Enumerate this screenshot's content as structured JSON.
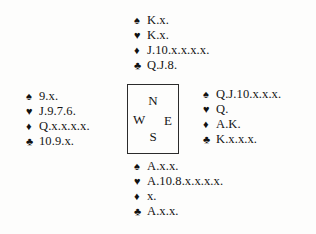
{
  "diagram": {
    "type": "bridge-deal",
    "suit_symbols": {
      "spades": "♠",
      "hearts": "♥",
      "diamonds": "♦",
      "clubs": "♣"
    },
    "compass": {
      "north": "N",
      "west": "W",
      "east": "E",
      "south": "S"
    },
    "hands": {
      "north": {
        "label": "North",
        "spades": "K.x.",
        "hearts": "K.x.",
        "diamonds": "J.10.x.x.x.x.",
        "clubs": "Q.J.8."
      },
      "west": {
        "label": "West",
        "spades": "9.x.",
        "hearts": "J.9.7.6.",
        "diamonds": "Q.x.x.x.x.",
        "clubs": "10.9.x."
      },
      "east": {
        "label": "East",
        "spades": "Q.J.10.x.x.x.",
        "hearts": "Q.",
        "diamonds": "A.K.",
        "clubs": "K.x.x.x."
      },
      "south": {
        "label": "South",
        "spades": "A.x.x.",
        "hearts": "A.10.8.x.x.x.x.",
        "diamonds": "x.",
        "clubs": "A.x.x."
      }
    }
  }
}
